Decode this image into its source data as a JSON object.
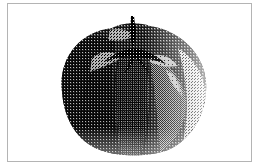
{
  "image": {
    "subject": "tomato",
    "style": "dithered black-and-white halftone",
    "alt": "Dithered halftone photograph of a ribbed tomato with stem"
  },
  "colors": {
    "border": "#b4b4b4",
    "background": "#ffffff",
    "ink": "#000000",
    "paper": "#ffffff"
  }
}
